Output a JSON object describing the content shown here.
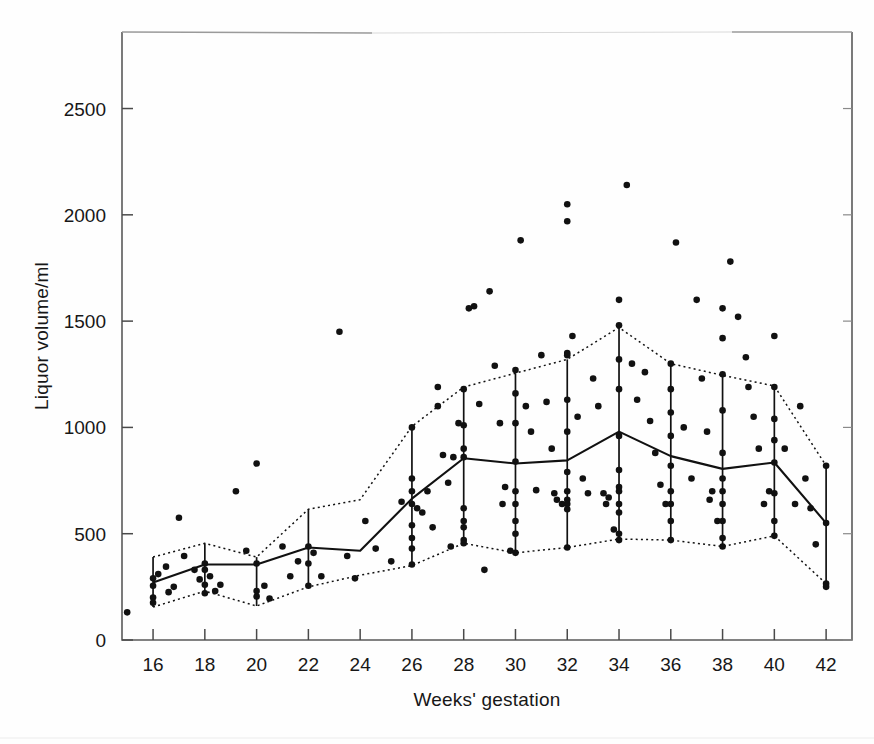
{
  "figure": {
    "title": "",
    "background_color": "#fefefe",
    "ink_color": "#111111"
  },
  "axes": {
    "x_label": "Weeks' gestation",
    "y_label": "Liquor volume/ml",
    "x_ticks": [
      "16",
      "18",
      "20",
      "22",
      "24",
      "26",
      "28",
      "30",
      "32",
      "34",
      "36",
      "38",
      "40",
      "42"
    ],
    "y_ticks": [
      "0",
      "500",
      "1000",
      "1500",
      "2000",
      "2500"
    ],
    "x_range": [
      14.8,
      43.0
    ],
    "y_range": [
      0,
      2860
    ],
    "frame": "box",
    "grid": "off"
  },
  "chart_data": {
    "type": "scatter",
    "title": "",
    "xlabel": "Weeks' gestation",
    "ylabel": "Liquor volume/ml",
    "xlim": [
      14.8,
      43.0
    ],
    "ylim": [
      0,
      2860
    ],
    "grid": false,
    "legend": "none",
    "x_tick_values": [
      16,
      18,
      20,
      22,
      24,
      26,
      28,
      30,
      32,
      34,
      36,
      38,
      40,
      42
    ],
    "y_tick_values": [
      0,
      500,
      1000,
      1500,
      2000,
      2500
    ],
    "series": [
      {
        "name": "median",
        "style": "solid-line",
        "x": [
          16,
          18,
          20,
          22,
          24,
          26,
          28,
          30,
          32,
          34,
          36,
          38,
          40,
          42
        ],
        "values": [
          270,
          355,
          355,
          435,
          420,
          665,
          855,
          830,
          845,
          980,
          865,
          805,
          835,
          550
        ]
      },
      {
        "name": "upper percentile",
        "style": "dotted-line",
        "x": [
          16,
          18,
          20,
          22,
          24,
          26,
          28,
          30,
          32,
          34,
          36,
          38,
          40,
          42
        ],
        "values": [
          390,
          455,
          390,
          615,
          660,
          1005,
          1190,
          1255,
          1320,
          1470,
          1300,
          1245,
          1195,
          820
        ]
      },
      {
        "name": "lower percentile",
        "style": "dotted-line",
        "x": [
          16,
          18,
          20,
          22,
          24,
          26,
          28,
          30,
          32,
          34,
          36,
          38,
          40,
          42
        ],
        "values": [
          155,
          230,
          160,
          250,
          305,
          350,
          455,
          410,
          435,
          475,
          470,
          440,
          490,
          265
        ]
      },
      {
        "name": "range bars",
        "style": "vertical-bar",
        "x": [
          16,
          18,
          20,
          22,
          26,
          28,
          30,
          32,
          34,
          36,
          38,
          40,
          42
        ],
        "low": [
          155,
          230,
          160,
          250,
          350,
          455,
          410,
          435,
          475,
          470,
          440,
          490,
          265
        ],
        "high": [
          390,
          455,
          390,
          615,
          1005,
          1190,
          1255,
          1320,
          1470,
          1300,
          1245,
          1195,
          820
        ]
      },
      {
        "name": "observations",
        "style": "points",
        "marker": "filled-circle",
        "points": [
          [
            15.0,
            130
          ],
          [
            16.0,
            290
          ],
          [
            16.0,
            255
          ],
          [
            16.0,
            200
          ],
          [
            16.0,
            175
          ],
          [
            16.2,
            310
          ],
          [
            16.5,
            345
          ],
          [
            16.6,
            225
          ],
          [
            16.8,
            250
          ],
          [
            17.0,
            575
          ],
          [
            17.2,
            395
          ],
          [
            17.6,
            330
          ],
          [
            17.8,
            285
          ],
          [
            18.0,
            360
          ],
          [
            18.0,
            330
          ],
          [
            18.0,
            260
          ],
          [
            18.0,
            220
          ],
          [
            18.2,
            300
          ],
          [
            18.4,
            230
          ],
          [
            18.6,
            260
          ],
          [
            19.2,
            700
          ],
          [
            19.6,
            420
          ],
          [
            20.0,
            830
          ],
          [
            20.0,
            360
          ],
          [
            20.0,
            230
          ],
          [
            20.0,
            205
          ],
          [
            20.3,
            255
          ],
          [
            20.5,
            195
          ],
          [
            21.0,
            440
          ],
          [
            21.3,
            300
          ],
          [
            21.6,
            370
          ],
          [
            22.0,
            440
          ],
          [
            22.0,
            360
          ],
          [
            22.0,
            255
          ],
          [
            22.2,
            410
          ],
          [
            22.5,
            300
          ],
          [
            23.2,
            1450
          ],
          [
            23.5,
            395
          ],
          [
            23.8,
            290
          ],
          [
            24.2,
            560
          ],
          [
            24.6,
            430
          ],
          [
            25.2,
            370
          ],
          [
            25.6,
            650
          ],
          [
            26.0,
            1000
          ],
          [
            26.0,
            760
          ],
          [
            26.0,
            700
          ],
          [
            26.0,
            640
          ],
          [
            26.0,
            540
          ],
          [
            26.0,
            480
          ],
          [
            26.0,
            430
          ],
          [
            26.0,
            355
          ],
          [
            26.2,
            620
          ],
          [
            26.4,
            600
          ],
          [
            26.6,
            700
          ],
          [
            26.8,
            530
          ],
          [
            27.0,
            1190
          ],
          [
            27.0,
            1100
          ],
          [
            27.2,
            870
          ],
          [
            27.4,
            740
          ],
          [
            27.5,
            440
          ],
          [
            27.6,
            860
          ],
          [
            27.8,
            1020
          ],
          [
            28.0,
            1180
          ],
          [
            28.0,
            1010
          ],
          [
            28.0,
            900
          ],
          [
            28.0,
            860
          ],
          [
            28.0,
            620
          ],
          [
            28.0,
            560
          ],
          [
            28.0,
            530
          ],
          [
            28.0,
            470
          ],
          [
            28.0,
            455
          ],
          [
            28.2,
            1560
          ],
          [
            28.4,
            1570
          ],
          [
            28.6,
            1110
          ],
          [
            28.8,
            330
          ],
          [
            29.0,
            1640
          ],
          [
            29.2,
            1290
          ],
          [
            29.4,
            1020
          ],
          [
            29.5,
            640
          ],
          [
            29.6,
            720
          ],
          [
            29.8,
            420
          ],
          [
            30.0,
            1270
          ],
          [
            30.0,
            1160
          ],
          [
            30.0,
            1020
          ],
          [
            30.0,
            840
          ],
          [
            30.0,
            700
          ],
          [
            30.0,
            640
          ],
          [
            30.0,
            560
          ],
          [
            30.0,
            500
          ],
          [
            30.0,
            410
          ],
          [
            30.2,
            1880
          ],
          [
            30.4,
            1100
          ],
          [
            30.6,
            980
          ],
          [
            30.8,
            705
          ],
          [
            31.0,
            1340
          ],
          [
            31.2,
            1120
          ],
          [
            31.4,
            900
          ],
          [
            31.5,
            690
          ],
          [
            31.6,
            660
          ],
          [
            31.8,
            640
          ],
          [
            32.0,
            2050
          ],
          [
            32.0,
            1970
          ],
          [
            32.0,
            1350
          ],
          [
            32.0,
            1340
          ],
          [
            32.0,
            1130
          ],
          [
            32.0,
            980
          ],
          [
            32.0,
            790
          ],
          [
            32.0,
            700
          ],
          [
            32.0,
            660
          ],
          [
            32.0,
            640
          ],
          [
            32.0,
            615
          ],
          [
            32.0,
            435
          ],
          [
            32.2,
            1430
          ],
          [
            32.4,
            1050
          ],
          [
            32.6,
            760
          ],
          [
            32.8,
            690
          ],
          [
            33.0,
            1230
          ],
          [
            33.2,
            1100
          ],
          [
            33.4,
            690
          ],
          [
            33.5,
            640
          ],
          [
            33.6,
            670
          ],
          [
            33.8,
            520
          ],
          [
            34.0,
            1600
          ],
          [
            34.0,
            1480
          ],
          [
            34.0,
            1320
          ],
          [
            34.0,
            1180
          ],
          [
            34.0,
            960
          ],
          [
            34.0,
            800
          ],
          [
            34.0,
            720
          ],
          [
            34.0,
            700
          ],
          [
            34.0,
            640
          ],
          [
            34.0,
            600
          ],
          [
            34.0,
            500
          ],
          [
            34.0,
            470
          ],
          [
            34.3,
            2140
          ],
          [
            34.5,
            1300
          ],
          [
            34.7,
            1130
          ],
          [
            35.0,
            1260
          ],
          [
            35.2,
            1030
          ],
          [
            35.4,
            880
          ],
          [
            35.6,
            730
          ],
          [
            35.8,
            640
          ],
          [
            36.0,
            1300
          ],
          [
            36.0,
            1180
          ],
          [
            36.0,
            1070
          ],
          [
            36.0,
            960
          ],
          [
            36.0,
            820
          ],
          [
            36.0,
            700
          ],
          [
            36.0,
            640
          ],
          [
            36.0,
            560
          ],
          [
            36.0,
            470
          ],
          [
            36.2,
            1870
          ],
          [
            36.5,
            1000
          ],
          [
            36.8,
            760
          ],
          [
            37.0,
            1600
          ],
          [
            37.2,
            1230
          ],
          [
            37.4,
            980
          ],
          [
            37.5,
            660
          ],
          [
            37.6,
            700
          ],
          [
            37.8,
            560
          ],
          [
            38.0,
            1560
          ],
          [
            38.0,
            1420
          ],
          [
            38.0,
            1250
          ],
          [
            38.0,
            1080
          ],
          [
            38.0,
            880
          ],
          [
            38.0,
            760
          ],
          [
            38.0,
            700
          ],
          [
            38.0,
            640
          ],
          [
            38.0,
            560
          ],
          [
            38.0,
            480
          ],
          [
            38.0,
            440
          ],
          [
            38.3,
            1780
          ],
          [
            38.6,
            1520
          ],
          [
            38.9,
            1330
          ],
          [
            39.0,
            1190
          ],
          [
            39.2,
            1050
          ],
          [
            39.4,
            900
          ],
          [
            39.6,
            640
          ],
          [
            39.8,
            700
          ],
          [
            40.0,
            1430
          ],
          [
            40.0,
            1190
          ],
          [
            40.0,
            1040
          ],
          [
            40.0,
            940
          ],
          [
            40.0,
            835
          ],
          [
            40.0,
            690
          ],
          [
            40.0,
            560
          ],
          [
            40.0,
            490
          ],
          [
            40.4,
            900
          ],
          [
            40.8,
            640
          ],
          [
            41.0,
            1100
          ],
          [
            41.2,
            760
          ],
          [
            41.4,
            620
          ],
          [
            41.6,
            450
          ],
          [
            42.0,
            820
          ],
          [
            42.0,
            550
          ],
          [
            42.0,
            265
          ],
          [
            42.0,
            250
          ]
        ]
      }
    ]
  }
}
